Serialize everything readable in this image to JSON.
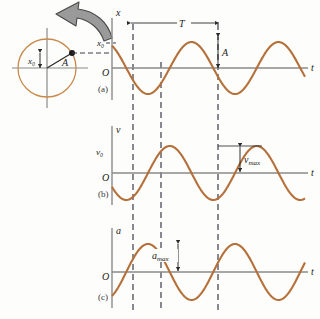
{
  "figure": {
    "background_color": "#fdfdfb",
    "curve_color": "#b5703a",
    "axis_color": "#8a8a8a",
    "dash_color": "#3b3b4a",
    "circle_color": "#c98a4b",
    "arrow_gray_fill": "#9a9a9a",
    "arrow_gray_stroke": "#4a4a4a"
  },
  "reference_circle": {
    "name": "reference-circle",
    "center": [
      47,
      68
    ],
    "radius": 29,
    "phasor_label": "A",
    "displacement_label": "x₀",
    "rotation_arrow": "counterclockwise",
    "point_angle_deg": 31
  },
  "panels": [
    {
      "id": "a",
      "caption": "(a)",
      "y_axis_label": "x",
      "x_axis_label": "t",
      "origin_label": "O",
      "annotations": [
        {
          "name": "initial-displacement",
          "label": "x₀"
        },
        {
          "name": "period-marker",
          "label": "T"
        },
        {
          "name": "amplitude-marker",
          "label": "A"
        }
      ]
    },
    {
      "id": "b",
      "caption": "(b)",
      "y_axis_label": "v",
      "x_axis_label": "t",
      "origin_label": "O",
      "annotations": [
        {
          "name": "initial-velocity",
          "label": "v₀"
        },
        {
          "name": "max-velocity-marker",
          "label": "v",
          "sub": "max"
        }
      ]
    },
    {
      "id": "c",
      "caption": "(c)",
      "y_axis_label": "a",
      "x_axis_label": "t",
      "origin_label": "O",
      "annotations": [
        {
          "name": "max-acceleration-marker",
          "label": "a",
          "sub": "max"
        }
      ]
    }
  ],
  "chart_data": {
    "type": "line",
    "xlabel": "t",
    "grid": false,
    "legend": null,
    "phase_deg": 31,
    "period_px": 87,
    "dashed_time_markers": [
      133,
      161,
      218
    ],
    "series": [
      {
        "name": "x",
        "ylabel": "x",
        "panel": "a",
        "amplitude": 1.0,
        "function": "A cos(2*pi*t/T + phi)",
        "initial_value_label": "x₀",
        "ylim": [
          -1.1,
          1.1
        ]
      },
      {
        "name": "v",
        "ylabel": "v",
        "panel": "b",
        "amplitude": 1.0,
        "function": "-v_max sin(2*pi*t/T + phi)",
        "initial_value_label": "v₀",
        "ylim": [
          -1.1,
          1.1
        ]
      },
      {
        "name": "a",
        "ylabel": "a",
        "panel": "c",
        "amplitude": 1.0,
        "function": "-a_max cos(2*pi*t/T + phi)",
        "ylim": [
          -1.1,
          1.1
        ]
      }
    ]
  }
}
